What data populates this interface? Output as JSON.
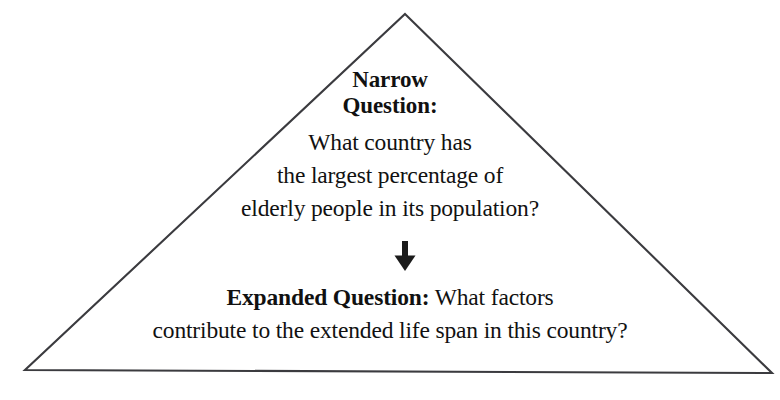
{
  "figure": {
    "name": "narrow-to-expanded-question-triangle",
    "background_color": "#ffffff",
    "outline_color": "#3b3b3f",
    "text_color": "#111111",
    "shape": "triangle"
  },
  "narrow_question": {
    "heading_line_1": "Narrow",
    "heading_line_2": "Question:",
    "body_line_1": "What country has",
    "body_line_2": "the largest percentage of",
    "body_line_3": "elderly people in its population?"
  },
  "arrow": {
    "icon": "arrow-down-icon",
    "direction": "down"
  },
  "expanded_question": {
    "label": "Expanded Question:",
    "line_1_rest": " What factors",
    "line_2": "contribute to the extended life span in this country?"
  }
}
